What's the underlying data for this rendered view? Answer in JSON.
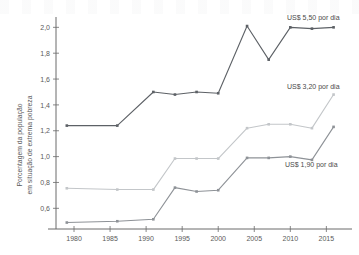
{
  "chart_data": {
    "type": "line",
    "title": "",
    "xlabel": "",
    "ylabel": "Porcentagem da população em situação de extrema pobreza",
    "ylabel_line1": "Porcentagem da população",
    "ylabel_line2": "em situação de extrema pobreza",
    "x": [
      1979,
      1986,
      1991,
      1994,
      1997,
      2000,
      2004,
      2007,
      2010,
      2013,
      2016
    ],
    "xtick_labels": [
      "1980",
      "1985",
      "1990",
      "1995",
      "2000",
      "2005",
      "2010",
      "2015"
    ],
    "xticks": [
      1980,
      1985,
      1990,
      1995,
      2000,
      2005,
      2010,
      2015
    ],
    "ytick_labels": [
      "0,6",
      "0,8",
      "1,0",
      "1,2",
      "1,4",
      "1,6",
      "1,8",
      "2,0"
    ],
    "yticks": [
      0.6,
      0.8,
      1.0,
      1.2,
      1.4,
      1.6,
      1.8,
      2.0
    ],
    "xlim": [
      1977.5,
      2018
    ],
    "ylim": [
      0.44,
      2.08
    ],
    "grid": false,
    "legend_position": "inline-right",
    "series": [
      {
        "name": "US$ 5,50 por dia",
        "color": "#5d6166",
        "label_text": "US$ 5,50 por dia",
        "values": [
          1.24,
          1.24,
          1.5,
          1.48,
          1.5,
          1.49,
          2.01,
          1.75,
          2.0,
          1.99,
          2.0
        ]
      },
      {
        "name": "US$ 3,20 por dia",
        "color": "#c3c6c9",
        "label_text": "US$ 3,20 por dia",
        "values": [
          0.755,
          0.745,
          0.745,
          0.985,
          0.985,
          0.985,
          1.22,
          1.25,
          1.25,
          1.22,
          1.48
        ]
      },
      {
        "name": "US$ 1,90 por dia",
        "color": "#8e9297",
        "label_text": "US$ 1,90 por dia",
        "values": [
          0.49,
          0.5,
          0.515,
          0.76,
          0.73,
          0.74,
          0.99,
          0.99,
          1.0,
          0.975,
          1.23
        ]
      }
    ]
  },
  "axis": {
    "y_title_line1": "Porcentagem da população",
    "y_title_line2": "em situação de extrema pobreza"
  }
}
